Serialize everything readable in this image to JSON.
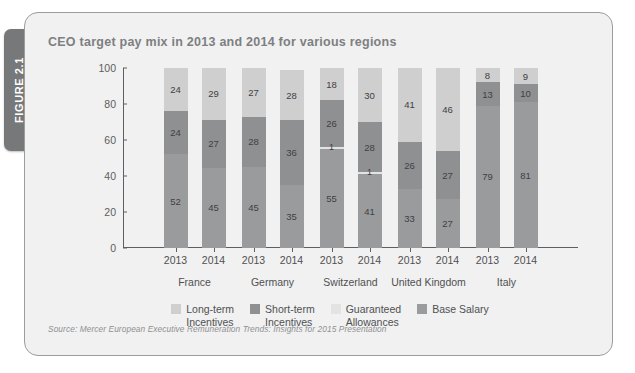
{
  "figure": {
    "tab_label": "FIGURE 2.1",
    "title": "CEO target pay mix in 2013 and 2014 for various regions",
    "source": "Source: Mercer European Executive Remuneration Trends: Insights for 2015 Presentation"
  },
  "colors": {
    "panel_bg": "#f1f1f1",
    "panel_border": "#9b9c9e",
    "tab_bg": "#76787a",
    "title_text": "#7d7f81",
    "axis": "#5e5f61",
    "long_term": "#cfcfcf",
    "short_term": "#8f9092",
    "guaranteed": "#e3e3e3",
    "base_salary": "#9a9b9d"
  },
  "chart_data": {
    "type": "bar",
    "subtype": "stacked-100-percent",
    "title": "CEO target pay mix in 2013 and 2014 for various regions",
    "xlabel": "",
    "ylabel": "",
    "ylim": [
      0,
      100
    ],
    "yticks": [
      "0",
      "20",
      "40",
      "60",
      "80",
      "100"
    ],
    "grid": false,
    "legend_position": "bottom",
    "groups": [
      "France",
      "Germany",
      "Switzerland",
      "United Kingdom",
      "Italy"
    ],
    "categories": [
      "2013",
      "2014",
      "2013",
      "2014",
      "2013",
      "2014",
      "2013",
      "2014",
      "2013",
      "2014"
    ],
    "series": [
      {
        "name": "Base Salary",
        "color": "#9a9b9d",
        "values": [
          52,
          45,
          45,
          35,
          55,
          41,
          33,
          27,
          79,
          81
        ]
      },
      {
        "name": "Guaranteed Allowances",
        "color": "#e3e3e3",
        "values": [
          0,
          0,
          0,
          0,
          1,
          1,
          0,
          0,
          0,
          0
        ]
      },
      {
        "name": "Short-term Incentives",
        "color": "#8f9092",
        "values": [
          24,
          27,
          28,
          36,
          26,
          28,
          26,
          27,
          13,
          10
        ]
      },
      {
        "name": "Long-term Incentives",
        "color": "#cfcfcf",
        "values": [
          24,
          29,
          27,
          28,
          18,
          30,
          41,
          46,
          8,
          9
        ]
      }
    ],
    "bars": [
      {
        "group": "France",
        "year": "2013",
        "segments": [
          {
            "series": "Base Salary",
            "value": 52,
            "label": "52"
          },
          {
            "series": "Short-term Incentives",
            "value": 24,
            "label": "24"
          },
          {
            "series": "Long-term Incentives",
            "value": 24,
            "label": "24"
          }
        ]
      },
      {
        "group": "France",
        "year": "2014",
        "segments": [
          {
            "series": "Base Salary",
            "value": 45,
            "label": "45"
          },
          {
            "series": "Short-term Incentives",
            "value": 27,
            "label": "27"
          },
          {
            "series": "Long-term Incentives",
            "value": 29,
            "label": "29"
          }
        ]
      },
      {
        "group": "Germany",
        "year": "2013",
        "segments": [
          {
            "series": "Base Salary",
            "value": 45,
            "label": "45"
          },
          {
            "series": "Short-term Incentives",
            "value": 28,
            "label": "28"
          },
          {
            "series": "Long-term Incentives",
            "value": 27,
            "label": "27"
          }
        ]
      },
      {
        "group": "Germany",
        "year": "2014",
        "segments": [
          {
            "series": "Base Salary",
            "value": 35,
            "label": "35"
          },
          {
            "series": "Short-term Incentives",
            "value": 36,
            "label": "36"
          },
          {
            "series": "Long-term Incentives",
            "value": 28,
            "label": "28"
          }
        ]
      },
      {
        "group": "Switzerland",
        "year": "2013",
        "segments": [
          {
            "series": "Base Salary",
            "value": 55,
            "label": "55"
          },
          {
            "series": "Guaranteed Allowances",
            "value": 1,
            "label": "1"
          },
          {
            "series": "Short-term Incentives",
            "value": 26,
            "label": "26"
          },
          {
            "series": "Long-term Incentives",
            "value": 18,
            "label": "18"
          }
        ]
      },
      {
        "group": "Switzerland",
        "year": "2014",
        "segments": [
          {
            "series": "Base Salary",
            "value": 41,
            "label": "41"
          },
          {
            "series": "Guaranteed Allowances",
            "value": 1,
            "label": "1"
          },
          {
            "series": "Short-term Incentives",
            "value": 28,
            "label": "28"
          },
          {
            "series": "Long-term Incentives",
            "value": 30,
            "label": "30"
          }
        ]
      },
      {
        "group": "United Kingdom",
        "year": "2013",
        "segments": [
          {
            "series": "Base Salary",
            "value": 33,
            "label": "33"
          },
          {
            "series": "Short-term Incentives",
            "value": 26,
            "label": "26"
          },
          {
            "series": "Long-term Incentives",
            "value": 41,
            "label": "41"
          }
        ]
      },
      {
        "group": "United Kingdom",
        "year": "2014",
        "segments": [
          {
            "series": "Base Salary",
            "value": 27,
            "label": "27"
          },
          {
            "series": "Short-term Incentives",
            "value": 27,
            "label": "27"
          },
          {
            "series": "Long-term Incentives",
            "value": 46,
            "label": "46"
          }
        ]
      },
      {
        "group": "Italy",
        "year": "2013",
        "segments": [
          {
            "series": "Base Salary",
            "value": 79,
            "label": "79"
          },
          {
            "series": "Short-term Incentives",
            "value": 13,
            "label": "13"
          },
          {
            "series": "Long-term Incentives",
            "value": 8,
            "label": "8"
          }
        ]
      },
      {
        "group": "Italy",
        "year": "2014",
        "segments": [
          {
            "series": "Base Salary",
            "value": 81,
            "label": "81"
          },
          {
            "series": "Short-term Incentives",
            "value": 10,
            "label": "10"
          },
          {
            "series": "Long-term Incentives",
            "value": 9,
            "label": "9"
          }
        ]
      }
    ],
    "legend": [
      {
        "label": "Long-term\nIncentives",
        "color": "#cfcfcf"
      },
      {
        "label": "Short-term\nIncentives",
        "color": "#8f9092"
      },
      {
        "label": "Guaranteed\nAllowances",
        "color": "#e3e3e3"
      },
      {
        "label": "Base Salary",
        "color": "#9a9b9d"
      }
    ]
  }
}
